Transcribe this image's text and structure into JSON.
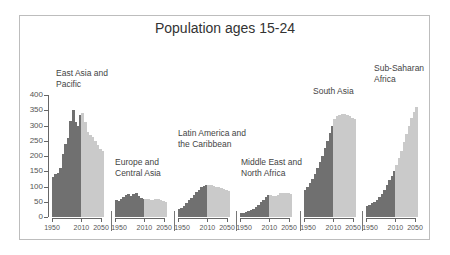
{
  "chart_data": {
    "type": "bar",
    "title": "Population ages 15-24",
    "xlabel": "",
    "ylabel": "",
    "ylim": [
      0,
      400
    ],
    "yticks": [
      0,
      50,
      100,
      150,
      200,
      250,
      300,
      350,
      400
    ],
    "xticks": [
      1950,
      2010,
      2050
    ],
    "grid": false,
    "legend": "none",
    "split_year": 2010,
    "x": [
      1950,
      1955,
      1960,
      1965,
      1970,
      1975,
      1980,
      1985,
      1990,
      1995,
      2000,
      2005,
      2010,
      2015,
      2020,
      2025,
      2030,
      2035,
      2040,
      2045,
      2050
    ],
    "series": [
      {
        "name": "East Asia and Pacific",
        "label_lines": [
          "East Asia and",
          "Pacific"
        ],
        "values": [
          130,
          140,
          145,
          160,
          205,
          240,
          260,
          315,
          350,
          310,
          300,
          335,
          340,
          310,
          280,
          270,
          262,
          250,
          235,
          222,
          215
        ]
      },
      {
        "name": "Europe and Central Asia",
        "label_lines": [
          "Europe and",
          "Central Asia"
        ],
        "values": [
          55,
          52,
          60,
          65,
          72,
          75,
          70,
          76,
          80,
          68,
          62,
          60,
          58,
          58,
          55,
          55,
          60,
          58,
          55,
          52,
          50
        ]
      },
      {
        "name": "Latin America and the Caribbean",
        "label_lines": [
          "Latin America and",
          "the Caribbean"
        ],
        "values": [
          25,
          30,
          35,
          45,
          55,
          62,
          72,
          82,
          90,
          97,
          102,
          105,
          105,
          105,
          103,
          100,
          98,
          95,
          92,
          88,
          85
        ]
      },
      {
        "name": "Middle East and North Africa",
        "label_lines": [
          "Middle East and",
          "North Africa"
        ],
        "values": [
          12,
          14,
          16,
          19,
          22,
          27,
          33,
          40,
          48,
          57,
          65,
          72,
          72,
          70,
          70,
          72,
          78,
          80,
          80,
          78,
          76
        ]
      },
      {
        "name": "South Asia",
        "label_lines": [
          "South Asia"
        ],
        "values": [
          90,
          100,
          110,
          125,
          140,
          160,
          180,
          200,
          225,
          250,
          275,
          300,
          320,
          330,
          335,
          338,
          337,
          335,
          330,
          325,
          320
        ]
      },
      {
        "name": "Sub-Saharan Africa",
        "label_lines": [
          "Sub-Saharan",
          "Africa"
        ],
        "values": [
          35,
          40,
          45,
          50,
          57,
          65,
          75,
          88,
          105,
          120,
          135,
          150,
          170,
          192,
          218,
          245,
          272,
          300,
          325,
          345,
          360
        ]
      }
    ]
  }
}
